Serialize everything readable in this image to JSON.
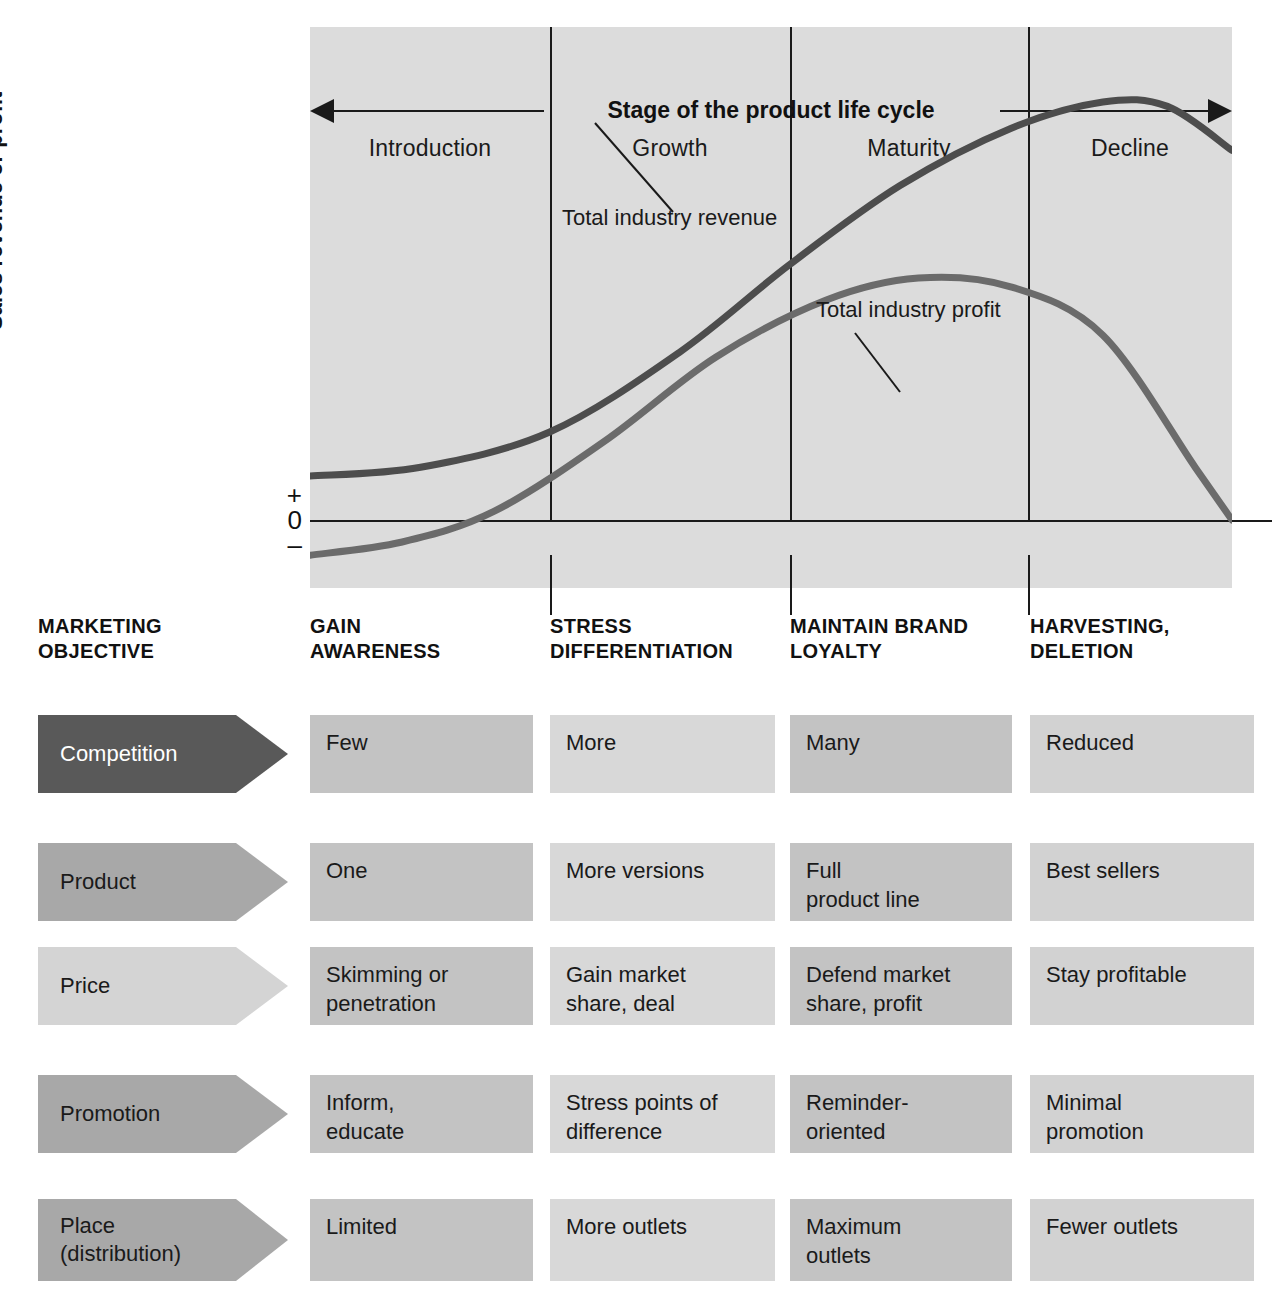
{
  "chart": {
    "y_axis_label": "Sales revenue or profit",
    "axis_plus": "+",
    "axis_zero": "0",
    "axis_minus": "–",
    "title": "Stage of the product life cycle",
    "stages": [
      "Introduction",
      "Growth",
      "Maturity",
      "Decline"
    ],
    "annotations": [
      {
        "text": "Total industry\nrevenue"
      },
      {
        "text": "Total industry\nprofit"
      }
    ]
  },
  "chart_data": {
    "type": "line",
    "title": "Stage of the product life cycle",
    "xlabel": "Stage of the product life cycle",
    "ylabel": "Sales revenue or profit",
    "categories": [
      "Introduction",
      "Growth",
      "Maturity",
      "Decline"
    ],
    "ytick_labels": [
      "+",
      "0",
      "–"
    ],
    "grid": false,
    "legend": "annotations on curves",
    "series": [
      {
        "name": "Total industry revenue",
        "points": [
          {
            "x": 0,
            "y": 0.1
          },
          {
            "x": 12,
            "y": 0.12
          },
          {
            "x": 26,
            "y": 0.2
          },
          {
            "x": 40,
            "y": 0.38
          },
          {
            "x": 52,
            "y": 0.58
          },
          {
            "x": 64,
            "y": 0.76
          },
          {
            "x": 76,
            "y": 0.89
          },
          {
            "x": 86,
            "y": 0.95
          },
          {
            "x": 93,
            "y": 0.94
          },
          {
            "x": 100,
            "y": 0.84
          }
        ]
      },
      {
        "name": "Total industry profit",
        "points": [
          {
            "x": 0,
            "y": -0.08
          },
          {
            "x": 10,
            "y": -0.05
          },
          {
            "x": 20,
            "y": 0.02
          },
          {
            "x": 32,
            "y": 0.18
          },
          {
            "x": 44,
            "y": 0.37
          },
          {
            "x": 56,
            "y": 0.5
          },
          {
            "x": 66,
            "y": 0.55
          },
          {
            "x": 76,
            "y": 0.53
          },
          {
            "x": 86,
            "y": 0.42
          },
          {
            "x": 96,
            "y": 0.12
          },
          {
            "x": 100,
            "y": 0.0
          }
        ]
      }
    ]
  },
  "matrix": {
    "objective_row_label": "MARKETING\nOBJECTIVE",
    "objectives": [
      "GAIN\nAWARENESS",
      "STRESS\nDIFFERENTIATION",
      "MAINTAIN BRAND\nLOYALTY",
      "HARVESTING,\nDELETION"
    ],
    "rows": [
      {
        "label": "Competition",
        "arrow_color": "#595959",
        "arrow_text_color": "#ffffff",
        "cells": [
          "Few",
          "More",
          "Many",
          "Reduced"
        ]
      },
      {
        "label": "Product",
        "arrow_color": "#a8a8a8",
        "arrow_text_color": "#1a1a1a",
        "cells": [
          "One",
          "More versions",
          "Full\nproduct line",
          "Best sellers"
        ]
      },
      {
        "label": "Price",
        "arrow_color": "#d4d4d4",
        "arrow_text_color": "#1a1a1a",
        "cells": [
          "Skimming or\npenetration",
          "Gain market\nshare, deal",
          "Defend market\nshare, profit",
          "Stay profitable"
        ]
      },
      {
        "label": "Promotion",
        "arrow_color": "#a8a8a8",
        "arrow_text_color": "#1a1a1a",
        "cells": [
          "Inform,\neducate",
          "Stress points of\ndifference",
          "Reminder-\noriented",
          "Minimal\npromotion"
        ]
      },
      {
        "label": "Place\n(distribution)",
        "arrow_color": "#a8a8a8",
        "arrow_text_color": "#1a1a1a",
        "cells": [
          "Limited",
          "More outlets",
          "Maximum\noutlets",
          "Fewer outlets"
        ]
      }
    ],
    "cell_colors": [
      "#c3c3c3",
      "#d8d8d8",
      "#c3c3c3",
      "#d2d2d2"
    ]
  },
  "colors": {
    "chart_background": "#dcdcdc",
    "curve": "#4d4d4d",
    "axis": "#1a1a1a",
    "text": "#1a1a1a"
  }
}
